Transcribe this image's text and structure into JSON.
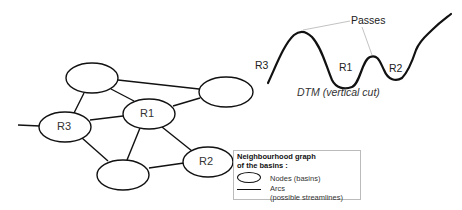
{
  "graph": {
    "nodes": [
      {
        "id": "top-left",
        "label": ""
      },
      {
        "id": "top-right",
        "label": ""
      },
      {
        "id": "r1",
        "label": "R1"
      },
      {
        "id": "r3",
        "label": "R3"
      },
      {
        "id": "bottom",
        "label": ""
      },
      {
        "id": "r2",
        "label": "R2"
      }
    ],
    "arcs": [
      [
        "top-left",
        "top-right"
      ],
      [
        "top-left",
        "r1"
      ],
      [
        "top-left",
        "r3"
      ],
      [
        "top-right",
        "r1"
      ],
      [
        "r3",
        "r1"
      ],
      [
        "r3",
        "bottom"
      ],
      [
        "r1",
        "bottom"
      ],
      [
        "r1",
        "r2"
      ],
      [
        "bottom",
        "r2"
      ],
      [
        "r3",
        "external"
      ]
    ]
  },
  "dtm": {
    "passes_label": "Passes",
    "region_labels": {
      "r3": "R3",
      "r1": "R1",
      "r2": "R2"
    },
    "caption": "DTM (vertical cut)"
  },
  "legend": {
    "title_line1": "Neighbourhood graph",
    "title_line2": "of the basins :",
    "nodes_label": "Nodes (basins)",
    "arcs_label_line1": "Arcs",
    "arcs_label_line2": "(possible streamlines)"
  }
}
